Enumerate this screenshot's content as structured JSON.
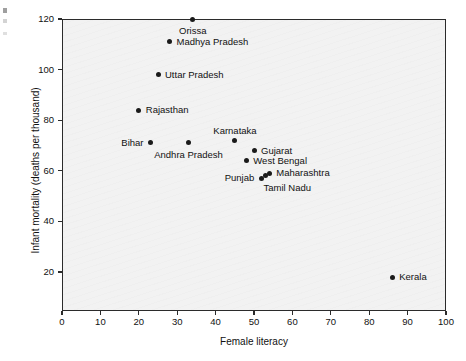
{
  "chart_data": {
    "type": "scatter",
    "title": "",
    "xlabel": "Female literacy",
    "ylabel": "Infant mortality (deaths per thousand)",
    "xlim": [
      0,
      100
    ],
    "ylim": [
      8,
      123
    ],
    "xticks": [
      0,
      10,
      20,
      30,
      40,
      50,
      60,
      70,
      80,
      90,
      100
    ],
    "yticks": [
      20,
      40,
      60,
      80,
      100,
      120
    ],
    "xtick_labels": [
      "0",
      "10",
      "20",
      "30",
      "40",
      "50",
      "60",
      "70",
      "80",
      "90",
      "100"
    ],
    "ytick_labels": [
      "20",
      "40",
      "60",
      "80",
      "100",
      "120"
    ],
    "grid": false,
    "legend": "none",
    "marker": "filled-circle",
    "marker_color": "#1a1a1a",
    "plot_background": "#f2f2f2",
    "points": [
      {
        "label": "Orissa",
        "x": 34,
        "y": 120,
        "label_pos": "below"
      },
      {
        "label": "Madhya Pradesh",
        "x": 28,
        "y": 111,
        "label_pos": "right"
      },
      {
        "label": "Uttar Pradesh",
        "x": 25,
        "y": 98,
        "label_pos": "right"
      },
      {
        "label": "Rajasthan",
        "x": 20,
        "y": 84,
        "label_pos": "right"
      },
      {
        "label": "Bihar",
        "x": 23,
        "y": 71,
        "label_pos": "left"
      },
      {
        "label": "Andhra Pradesh",
        "x": 33,
        "y": 71,
        "label_pos": "below"
      },
      {
        "label": "Karnataka",
        "x": 45,
        "y": 72,
        "label_pos": "above"
      },
      {
        "label": "Gujarat",
        "x": 50,
        "y": 68,
        "label_pos": "right"
      },
      {
        "label": "West Bengal",
        "x": 48,
        "y": 64,
        "label_pos": "right"
      },
      {
        "label": "Maharashtra",
        "x": 54,
        "y": 59,
        "label_pos": "right"
      },
      {
        "label": "Tamil Nadu",
        "x": 53,
        "y": 58,
        "label_pos": "below-right"
      },
      {
        "label": "Punjab",
        "x": 52,
        "y": 57,
        "label_pos": "left"
      },
      {
        "label": "Kerala",
        "x": 86,
        "y": 18,
        "label_pos": "right"
      }
    ]
  }
}
